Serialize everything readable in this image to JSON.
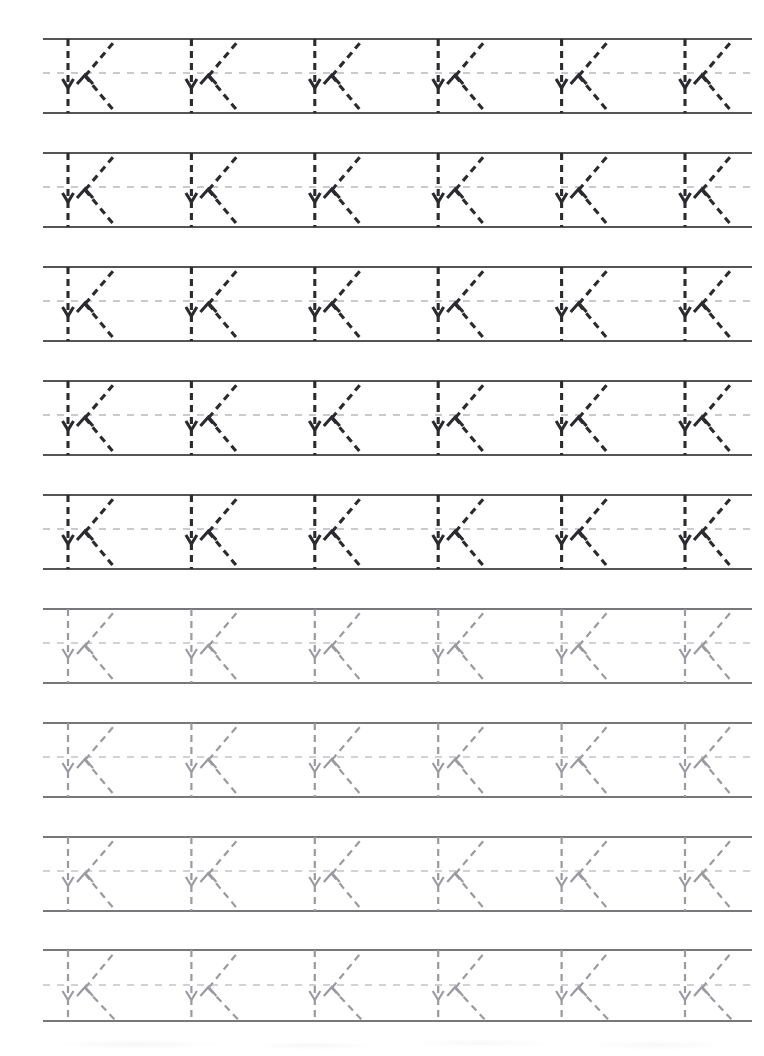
{
  "worksheet": {
    "title": "Letter K Tracing Practice Worksheet",
    "letter": "K",
    "letter_case": "uppercase",
    "page_width": 764,
    "page_height": 1056,
    "background_color": "#ffffff",
    "rows_count": 9,
    "letters_per_row": 6,
    "total_letters": 54
  },
  "geometry": {
    "content_left": 43,
    "content_right": 752,
    "first_row_top_line_y": 39,
    "row_pitch": 113.9,
    "row_top_to_mid": 34,
    "row_top_to_bottom": 74,
    "first_stem_x": 68,
    "letter_pitch": 123.4,
    "stem_x_positions": [
      68,
      191.4,
      314.8,
      438.2,
      561.6,
      685
    ],
    "junction_offset_x": 17,
    "upper_arm_end_offset_x": 46,
    "lower_arm_end_offset_x": 47
  },
  "colors": {
    "dark_stroke": "#2b2b2f",
    "light_stroke": "#9a9aa0",
    "guide_line_dark": "#555558",
    "guide_line_light": "#77777c",
    "midline_dash_dark": "#b9b9be",
    "midline_dash_light": "#c3c3c8",
    "paper": "#ffffff"
  },
  "stroke_styles": {
    "dark_width": 3.1,
    "light_width": 2.2,
    "guide_width_dark": 2.0,
    "guide_width_light": 1.6,
    "midline_width": 1.3,
    "letter_dash_pattern": "7,5",
    "midline_dash_pattern": "7,7"
  },
  "rows": [
    {
      "index": 1,
      "tone": "dark",
      "top_line_y": 39,
      "mid_line_y": 73,
      "bottom_line_y": 113,
      "letters": [
        "K",
        "K",
        "K",
        "K",
        "K",
        "K"
      ]
    },
    {
      "index": 2,
      "tone": "dark",
      "top_line_y": 153,
      "mid_line_y": 187,
      "bottom_line_y": 227,
      "letters": [
        "K",
        "K",
        "K",
        "K",
        "K",
        "K"
      ]
    },
    {
      "index": 3,
      "tone": "dark",
      "top_line_y": 267,
      "mid_line_y": 301,
      "bottom_line_y": 341,
      "letters": [
        "K",
        "K",
        "K",
        "K",
        "K",
        "K"
      ]
    },
    {
      "index": 4,
      "tone": "dark",
      "top_line_y": 381,
      "mid_line_y": 415,
      "bottom_line_y": 455,
      "letters": [
        "K",
        "K",
        "K",
        "K",
        "K",
        "K"
      ]
    },
    {
      "index": 5,
      "tone": "dark",
      "top_line_y": 495,
      "mid_line_y": 529,
      "bottom_line_y": 569,
      "letters": [
        "K",
        "K",
        "K",
        "K",
        "K",
        "K"
      ]
    },
    {
      "index": 6,
      "tone": "light",
      "top_line_y": 609,
      "mid_line_y": 643,
      "bottom_line_y": 683,
      "letters": [
        "K",
        "K",
        "K",
        "K",
        "K",
        "K"
      ]
    },
    {
      "index": 7,
      "tone": "light",
      "top_line_y": 723,
      "mid_line_y": 757,
      "bottom_line_y": 797,
      "letters": [
        "K",
        "K",
        "K",
        "K",
        "K",
        "K"
      ]
    },
    {
      "index": 8,
      "tone": "light",
      "top_line_y": 837,
      "mid_line_y": 871,
      "bottom_line_y": 911,
      "letters": [
        "K",
        "K",
        "K",
        "K",
        "K",
        "K"
      ]
    },
    {
      "index": 9,
      "tone": "light",
      "top_line_y": 950,
      "mid_line_y": 985,
      "bottom_line_y": 1021,
      "letters": [
        "K",
        "K",
        "K",
        "K",
        "K",
        "K"
      ]
    }
  ],
  "letter_form": {
    "description": "Uppercase K drawn as three dashed guide strokes with directional arrowheads",
    "strokes": [
      {
        "name": "vertical-stem",
        "direction": "top-to-bottom",
        "arrow": "down",
        "arrow_at_fraction": 0.62
      },
      {
        "name": "upper-diagonal-arm",
        "direction": "down-left-to-up-right",
        "arrow": "up-right",
        "arrow_at_fraction": 0.18
      },
      {
        "name": "lower-diagonal-arm",
        "direction": "up-left-to-down-right",
        "arrow": "down-right",
        "arrow_at_fraction": 1.0
      }
    ]
  }
}
